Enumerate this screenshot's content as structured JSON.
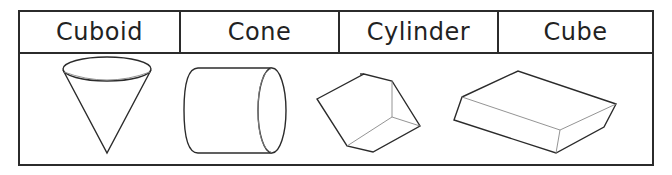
{
  "table": {
    "headers": [
      {
        "label": "Cuboid",
        "width": 159
      },
      {
        "label": "Cone",
        "width": 159
      },
      {
        "label": "Cylinder",
        "width": 159
      },
      {
        "label": "Cube",
        "width": 155
      }
    ],
    "shapes": [
      {
        "name": "cone",
        "depicted": "cone (inverted)"
      },
      {
        "name": "cylinder",
        "depicted": "cylinder (horizontal)"
      },
      {
        "name": "cube",
        "depicted": "cube (tilted)"
      },
      {
        "name": "cuboid",
        "depicted": "cuboid (flat slab)"
      }
    ]
  },
  "colors": {
    "line": "#2b2b2b",
    "thin_line": "#777777",
    "background": "#ffffff"
  }
}
